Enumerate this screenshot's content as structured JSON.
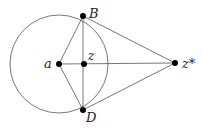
{
  "diagram": {
    "colors": {
      "stroke": "#555555",
      "point": "#000000",
      "background": "#ffffff"
    },
    "circle": {
      "cx": 59,
      "cy": 64,
      "r": 49
    },
    "points": {
      "a": {
        "x": 59,
        "y": 64,
        "label": "a"
      },
      "z": {
        "x": 84,
        "y": 64,
        "label": "z"
      },
      "B": {
        "x": 83,
        "y": 16,
        "label": "B"
      },
      "D": {
        "x": 83,
        "y": 110,
        "label": "D"
      },
      "zstar": {
        "x": 175,
        "y": 63,
        "label": "z*"
      }
    },
    "segments": [
      [
        "a",
        "B"
      ],
      [
        "a",
        "D"
      ],
      [
        "B",
        "D"
      ],
      [
        "a",
        "zstar"
      ],
      [
        "B",
        "zstar"
      ],
      [
        "D",
        "zstar"
      ]
    ]
  }
}
